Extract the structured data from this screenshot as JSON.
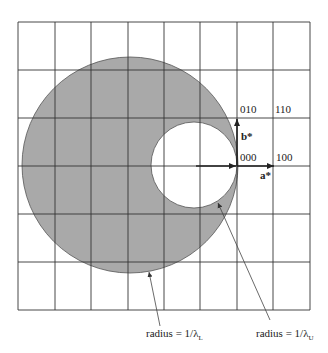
{
  "diagram": {
    "type": "Ewald sphere construction / reciprocal lattice limiting spheres",
    "grid": {
      "cols": 8,
      "rows": 6,
      "x0": 18,
      "y0": 22,
      "cell_w": 36.5,
      "cell_h": 48
    },
    "labels": {
      "p010": "010",
      "p110": "110",
      "p000": "000",
      "p100": "100",
      "b_axis": "b*",
      "a_axis": "a*",
      "radius_L_prefix": "radius = 1/λ",
      "radius_L_sub": "L",
      "radius_U_prefix": "radius = 1/λ",
      "radius_U_sub": "U"
    },
    "colors": {
      "shade": "#a9a9a9",
      "line": "#333333",
      "background": "#ffffff"
    }
  }
}
